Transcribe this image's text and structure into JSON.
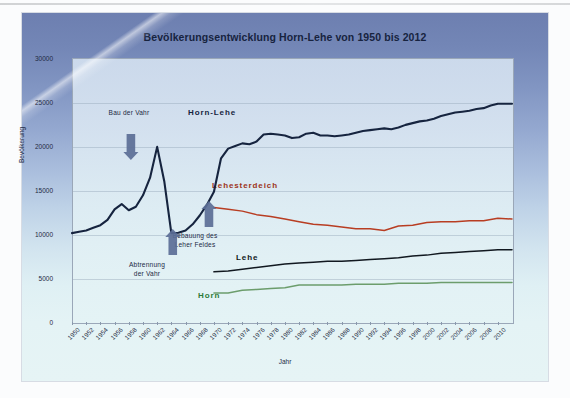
{
  "chart_data": {
    "type": "line",
    "title": "Bevölkerungsentwicklung Horn-Lehe von 1950 bis 2012",
    "xlabel": "Jahr",
    "ylabel": "Bevölkerung",
    "ylim": [
      0,
      30000
    ],
    "ytick_labels": [
      "30000",
      "25000",
      "20000",
      "15000",
      "10000",
      "5000",
      "0"
    ],
    "ytick_values": [
      30000,
      25000,
      20000,
      15000,
      10000,
      5000,
      0
    ],
    "xlim": [
      1950,
      2012
    ],
    "xtick_labels": [
      "1950",
      "1952",
      "1954",
      "1956",
      "1958",
      "1960",
      "1962",
      "1964",
      "1966",
      "1968",
      "1970",
      "1972",
      "1974",
      "1976",
      "1978",
      "1980",
      "1982",
      "1984",
      "1986",
      "1988",
      "1990",
      "1992",
      "1994",
      "1996",
      "1998",
      "2000",
      "2002",
      "2004",
      "2006",
      "2008",
      "2010"
    ],
    "grid": true,
    "legend": "inline-labels",
    "series": [
      {
        "name": "Horn-Lehe",
        "color": "#16243f",
        "label_position": "top-center-left",
        "x": [
          1950,
          1951,
          1952,
          1953,
          1954,
          1955,
          1956,
          1957,
          1958,
          1959,
          1960,
          1961,
          1962,
          1963,
          1964,
          1965,
          1966,
          1967,
          1968,
          1969,
          1970,
          1971,
          1972,
          1973,
          1974,
          1975,
          1976,
          1977,
          1978,
          1979,
          1980,
          1981,
          1982,
          1983,
          1984,
          1985,
          1986,
          1987,
          1988,
          1989,
          1990,
          1991,
          1992,
          1993,
          1994,
          1995,
          1996,
          1997,
          1998,
          1999,
          2000,
          2001,
          2002,
          2003,
          2004,
          2005,
          2006,
          2007,
          2008,
          2009,
          2010,
          2011,
          2012
        ],
        "y": [
          10100,
          10250,
          10400,
          10700,
          11000,
          11600,
          12800,
          13400,
          12700,
          13100,
          14400,
          16400,
          19900,
          16000,
          10100,
          10150,
          10400,
          11100,
          12100,
          13300,
          14800,
          18600,
          19700,
          20000,
          20300,
          20200,
          20500,
          21300,
          21400,
          21300,
          21200,
          20900,
          21000,
          21400,
          21500,
          21200,
          21200,
          21100,
          21200,
          21300,
          21500,
          21700,
          21800,
          21900,
          22000,
          21900,
          22100,
          22400,
          22600,
          22800,
          22900,
          23100,
          23400,
          23600,
          23800,
          23900,
          24000,
          24200,
          24300,
          24600,
          24800,
          24800,
          24800
        ]
      },
      {
        "name": "Lehesterdeich",
        "color": "#b83d22",
        "label_position": "mid-left",
        "x": [
          1970,
          1972,
          1974,
          1976,
          1978,
          1980,
          1982,
          1984,
          1986,
          1988,
          1990,
          1992,
          1994,
          1996,
          1998,
          2000,
          2002,
          2004,
          2006,
          2008,
          2010,
          2012
        ],
        "y": [
          13000,
          12800,
          12600,
          12200,
          12000,
          11700,
          11400,
          11100,
          11000,
          10800,
          10600,
          10600,
          10400,
          10900,
          11000,
          11300,
          11400,
          11400,
          11500,
          11500,
          11800,
          11700
        ]
      },
      {
        "name": "Lehe",
        "color": "#111820",
        "label_position": "mid-left",
        "x": [
          1970,
          1972,
          1974,
          1976,
          1978,
          1980,
          1982,
          1984,
          1986,
          1988,
          1990,
          1992,
          1994,
          1996,
          1998,
          2000,
          2002,
          2004,
          2006,
          2008,
          2010,
          2012
        ],
        "y": [
          5700,
          5800,
          6000,
          6200,
          6400,
          6600,
          6700,
          6800,
          6900,
          6900,
          7000,
          7100,
          7200,
          7300,
          7500,
          7600,
          7800,
          7900,
          8000,
          8100,
          8200,
          8200
        ]
      },
      {
        "name": "Horn",
        "color": "#6c9d6c",
        "label_position": "bottom-left",
        "x": [
          1970,
          1972,
          1974,
          1976,
          1978,
          1980,
          1982,
          1984,
          1986,
          1988,
          1990,
          1992,
          1994,
          1996,
          1998,
          2000,
          2002,
          2004,
          2006,
          2008,
          2010,
          2012
        ],
        "y": [
          3300,
          3300,
          3600,
          3700,
          3800,
          3900,
          4200,
          4200,
          4200,
          4200,
          4300,
          4300,
          4300,
          4400,
          4400,
          4400,
          4500,
          4500,
          4500,
          4500,
          4500,
          4500
        ]
      }
    ],
    "annotations": [
      {
        "text": "Bau der Vahr",
        "arrow": "down",
        "at_year": 1958
      },
      {
        "text": "Abtrennung\nder Vahr",
        "arrow": "up",
        "at_year": 1964
      },
      {
        "text": "Bebauung des\nLeher Feldes",
        "arrow": "up",
        "at_year": 1969
      }
    ],
    "colors": {
      "horn_lehe": "#16243f",
      "lehesterdeich": "#b83d22",
      "lehe": "#111820",
      "horn": "#6c9d6c",
      "arrow": "#5b6e96",
      "plot_background": "#dceaf2",
      "card_background_top": "#6d7fb0",
      "card_background_bottom": "#e6f4f5"
    }
  },
  "annotations_text": {
    "bau_der_vahr": "Bau der Vahr",
    "abtrennung_line1": "Abtrennung",
    "abtrennung_line2": "der Vahr",
    "bebauung_line1": "Bebauung des",
    "bebauung_line2": "Leher Feldes"
  },
  "series_labels": {
    "horn_lehe": "Horn-Lehe",
    "lehesterdeich": "Lehesterdeich",
    "lehe": "Lehe",
    "horn": "Horn"
  }
}
